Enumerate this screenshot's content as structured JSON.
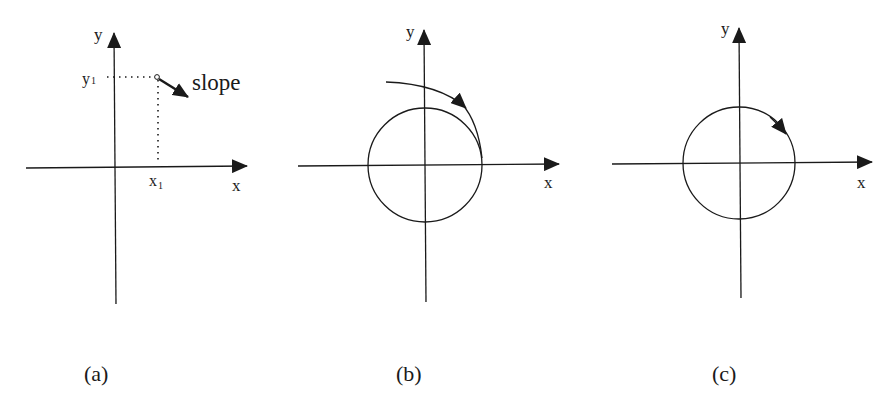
{
  "panels": [
    {
      "id": "a",
      "caption": "(a)",
      "x_axis_label": "x",
      "y_axis_label": "y",
      "point_x_label": "x",
      "point_x_sub": "1",
      "point_y_label": "y",
      "point_y_sub": "1",
      "annotation": "slope"
    },
    {
      "id": "b",
      "caption": "(b)",
      "x_axis_label": "x",
      "y_axis_label": "y"
    },
    {
      "id": "c",
      "caption": "(c)",
      "x_axis_label": "x",
      "y_axis_label": "y"
    }
  ],
  "colors": {
    "stroke": "#1a1a1a",
    "background": "#ffffff"
  }
}
